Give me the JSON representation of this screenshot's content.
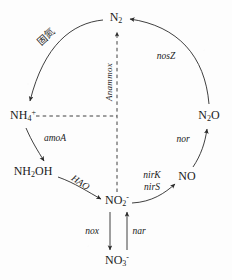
{
  "diagram": {
    "type": "cycle-diagram",
    "background_color": "#fdfdfd",
    "stroke_color": "#2a2a2a",
    "nodes": [
      {
        "id": "n2",
        "label_html": "N<sub>2</sub>",
        "text": "N2",
        "x": 116,
        "y": 18
      },
      {
        "id": "nh4",
        "label_html": "NH<sub>4</sub><sup>+</sup>",
        "text": "NH4+",
        "x": 23,
        "y": 116
      },
      {
        "id": "nh2oh",
        "label_html": "NH<sub>2</sub>OH",
        "text": "NH2OH",
        "x": 33,
        "y": 172
      },
      {
        "id": "no2",
        "label_html": "NO<sub>2</sub><sup>-</sup>",
        "text": "NO2-",
        "x": 117,
        "y": 201
      },
      {
        "id": "no3",
        "label_html": "NO<sub>3</sub><sup>-</sup>",
        "text": "NO3-",
        "x": 117,
        "y": 261
      },
      {
        "id": "no",
        "label_html": "NO",
        "text": "NO",
        "x": 187,
        "y": 176
      },
      {
        "id": "n2o",
        "label_html": "N<sub>2</sub>O",
        "text": "N2O",
        "x": 209,
        "y": 116
      }
    ],
    "gene_labels": [
      {
        "id": "nosZ",
        "text": "nosZ",
        "x": 166,
        "y": 57,
        "rotation": 0
      },
      {
        "id": "anammox",
        "text": "Anammox",
        "x": 109,
        "y": 82,
        "rotation": -90
      },
      {
        "id": "amoA",
        "text": "amoA",
        "x": 55,
        "y": 139,
        "rotation": 0
      },
      {
        "id": "hao",
        "text": "HAO",
        "x": 80,
        "y": 183,
        "rotation": 34
      },
      {
        "id": "nirK",
        "text": "nirK",
        "x": 152,
        "y": 176,
        "rotation": 0
      },
      {
        "id": "nirS",
        "text": "nirS",
        "x": 152,
        "y": 188,
        "rotation": 0
      },
      {
        "id": "nor",
        "text": "nor",
        "x": 183,
        "y": 140,
        "rotation": 0
      },
      {
        "id": "nox",
        "text": "nox",
        "x": 92,
        "y": 232,
        "rotation": 0
      },
      {
        "id": "nar",
        "text": "nar",
        "x": 139,
        "y": 232,
        "rotation": 0
      }
    ],
    "annotations": [
      {
        "id": "fixation",
        "text": "固氮",
        "x": 46,
        "y": 37,
        "rotation": -42
      }
    ],
    "arrows": [
      {
        "id": "n2-to-nh4",
        "from": "n2",
        "to": "nh4",
        "style": "curved-solid",
        "label": "固氮"
      },
      {
        "id": "nh4-to-nh2oh",
        "from": "nh4",
        "to": "nh2oh",
        "style": "curved-solid",
        "label": "amoA"
      },
      {
        "id": "nh2oh-to-no2",
        "from": "nh2oh",
        "to": "no2",
        "style": "curved-solid",
        "label": "HAO"
      },
      {
        "id": "no2-to-no3",
        "from": "no2",
        "to": "no3",
        "style": "straight-solid",
        "label": "nox"
      },
      {
        "id": "no3-to-no2",
        "from": "no3",
        "to": "no2",
        "style": "straight-solid",
        "label": "nar"
      },
      {
        "id": "no2-to-no",
        "from": "no2",
        "to": "no",
        "style": "curved-solid",
        "label": "nirK / nirS"
      },
      {
        "id": "no-to-n2o",
        "from": "no",
        "to": "n2o",
        "style": "curved-solid",
        "label": "nor"
      },
      {
        "id": "n2o-to-n2",
        "from": "n2o",
        "to": "n2",
        "style": "curved-solid",
        "label": "nosZ"
      },
      {
        "id": "no2-to-n2",
        "from": "no2",
        "to": "n2",
        "style": "dashed",
        "label": "Anammox"
      },
      {
        "id": "nh4-to-center",
        "from": "nh4",
        "to": "center",
        "style": "dashed",
        "label": ""
      }
    ]
  }
}
